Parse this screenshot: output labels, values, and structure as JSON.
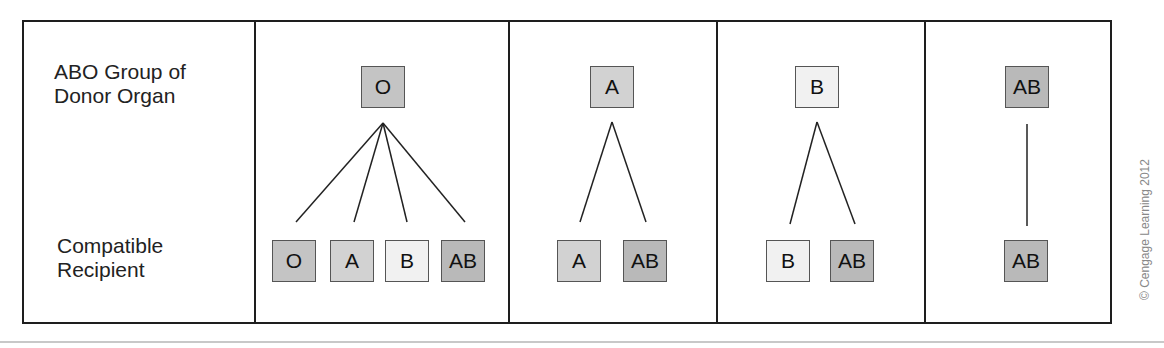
{
  "row_labels": {
    "donor": [
      "ABO Group of",
      "Donor Organ"
    ],
    "recipient": [
      "Compatible",
      "Recipient"
    ]
  },
  "colors": {
    "O": "#c4c4c4",
    "A": "#d2d2d2",
    "B": "#f1f1f1",
    "AB": "#b9b9b9"
  },
  "groups": [
    {
      "donor": "O",
      "recipients": [
        "O",
        "A",
        "B",
        "AB"
      ]
    },
    {
      "donor": "A",
      "recipients": [
        "A",
        "AB"
      ]
    },
    {
      "donor": "B",
      "recipients": [
        "B",
        "AB"
      ]
    },
    {
      "donor": "AB",
      "recipients": [
        "AB"
      ]
    }
  ],
  "credit": "© Cengage Learning 2012"
}
